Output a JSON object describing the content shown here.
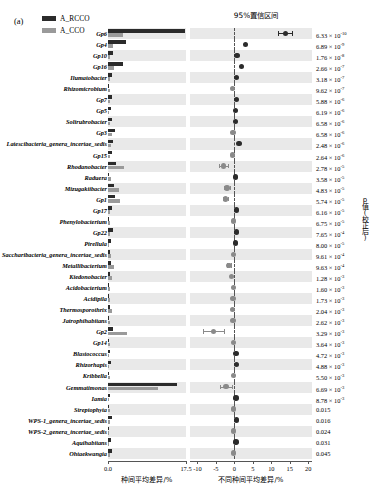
{
  "panel": {
    "label": "(a)"
  },
  "legend": {
    "items": [
      {
        "label": "A_RCCO",
        "color": "#2b2b2b"
      },
      {
        "label": "A_CCO",
        "color": "#9a9a9a"
      }
    ]
  },
  "titles": {
    "ci_title": "95%置信区间",
    "xlabel_left": "种间平均差异/%",
    "xlabel_right": "不同种间平均差异/%",
    "ylabel_right": "p值(校正后)"
  },
  "axes": {
    "left": {
      "ticks": [
        "0.0",
        "17.5"
      ],
      "min": 0,
      "max": 17.5
    },
    "right": {
      "ticks": [
        "-10",
        "-5",
        "0",
        "5",
        "10",
        "15",
        "20"
      ],
      "min": -12,
      "max": 21
    }
  },
  "chart_data": {
    "type": "bar",
    "title": "95%置信区间",
    "xlabel": "不同种间平均差异/%",
    "ylabel": "p值(校正后)",
    "series_names": [
      "A_RCCO",
      "A_CCO"
    ],
    "categories": [
      "Gp6",
      "Gp4",
      "Gp10",
      "Gp16",
      "Ilumatobacter",
      "Rhizomicrobium",
      "Gp7",
      "Gp5",
      "Solirubrobacter",
      "Gp3",
      "Latescibacteria_genera_incertae_sedis",
      "Gp15",
      "Rhodanobacter",
      "Raduera",
      "Mizugakiibacter",
      "Gp1",
      "Gp17",
      "Phenylobacterium",
      "Gp22",
      "Pirellula",
      "Saccharibacteria_genera_incertae_sedis",
      "Metallibacterium",
      "Kiedonobacter",
      "Acidobacterium",
      "Acidipila",
      "Thermosporothrix",
      "Jatrophihabitans",
      "Gp2",
      "Gp14",
      "Blastococcus",
      "Rhizorhapis",
      "Kribbella",
      "Gemmatimonas",
      "Iamia",
      "Streptophyta",
      "WPS-1_genera_incertae_sedis",
      "WPS-2_genera_incertae_sedis",
      "Aquihabitans",
      "Ohtaekwangia"
    ],
    "rows": [
      {
        "taxon": "Gp6",
        "rcco": 17.2,
        "cco": 3.4,
        "diff": 13.8,
        "ci_low": 11.9,
        "ci_high": 15.6,
        "p": "6.33 × 10",
        "p_exp": "-10"
      },
      {
        "taxon": "Gp4",
        "rcco": 4.0,
        "cco": 1.2,
        "diff": 3.0,
        "ci_low": 2.6,
        "ci_high": 3.4,
        "p": "6.89 × 10",
        "p_exp": "-9"
      },
      {
        "taxon": "Gp10",
        "rcco": 1.1,
        "cco": 0.5,
        "diff": 0.7,
        "ci_low": 0.5,
        "ci_high": 0.9,
        "p": "1.76 × 10",
        "p_exp": "-8"
      },
      {
        "taxon": "Gp16",
        "rcco": 3.3,
        "cco": 1.4,
        "diff": 1.9,
        "ci_low": 1.6,
        "ci_high": 2.2,
        "p": "2.66 × 10",
        "p_exp": "-7"
      },
      {
        "taxon": "Ilumatobacter",
        "rcco": 0.9,
        "cco": 0.4,
        "diff": 0.6,
        "ci_low": 0.4,
        "ci_high": 0.8,
        "p": "3.18 × 10",
        "p_exp": "-7"
      },
      {
        "taxon": "Rhizomicrobium",
        "rcco": 0.2,
        "cco": 0.5,
        "diff": -0.5,
        "ci_low": -0.8,
        "ci_high": -0.2,
        "p": "9.62 × 10",
        "p_exp": "-7"
      },
      {
        "taxon": "Gp7",
        "rcco": 1.0,
        "cco": 0.4,
        "diff": 0.5,
        "ci_low": 0.3,
        "ci_high": 0.7,
        "p": "5.88 × 10",
        "p_exp": "-6"
      },
      {
        "taxon": "Gp5",
        "rcco": 0.6,
        "cco": 0.3,
        "diff": 0.3,
        "ci_low": 0.2,
        "ci_high": 0.5,
        "p": "6.19 × 10",
        "p_exp": "-6"
      },
      {
        "taxon": "Solirubrobacter",
        "rcco": 0.9,
        "cco": 0.4,
        "diff": 0.3,
        "ci_low": 0.2,
        "ci_high": 0.5,
        "p": "6.58 × 10",
        "p_exp": "-6"
      },
      {
        "taxon": "Gp3",
        "rcco": 1.5,
        "cco": 0.9,
        "diff": -0.4,
        "ci_low": -0.7,
        "ci_high": -0.1,
        "p": "6.58 × 10",
        "p_exp": "-6"
      },
      {
        "taxon": "Latescibacteria_genera_incertae_sedis",
        "rcco": 1.2,
        "cco": 0.6,
        "diff": 1.2,
        "ci_low": 0.9,
        "ci_high": 1.5,
        "p": "2.48 × 10",
        "p_exp": "-6"
      },
      {
        "taxon": "Gp15",
        "rcco": 1.0,
        "cco": 0.5,
        "diff": -0.5,
        "ci_low": -0.8,
        "ci_high": -0.3,
        "p": "2.64 × 10",
        "p_exp": "-6"
      },
      {
        "taxon": "Rhodanobacter",
        "rcco": 1.8,
        "cco": 3.6,
        "diff": -3.0,
        "ci_low": -4.2,
        "ci_high": -1.8,
        "p": "2.78 × 10",
        "p_exp": "-5"
      },
      {
        "taxon": "Raduera",
        "rcco": 0.3,
        "cco": 0.6,
        "diff": 0.3,
        "ci_low": 0.1,
        "ci_high": 0.6,
        "p": "3.58 × 10",
        "p_exp": "-5"
      },
      {
        "taxon": "Mizugakiibacter",
        "rcco": 1.3,
        "cco": 2.4,
        "diff": -2.0,
        "ci_low": -2.8,
        "ci_high": -1.2,
        "p": "4.83 × 10",
        "p_exp": "-5"
      },
      {
        "taxon": "Gp1",
        "rcco": 1.6,
        "cco": 2.6,
        "diff": -2.4,
        "ci_low": -3.1,
        "ci_high": -1.7,
        "p": "5.74 × 10",
        "p_exp": "-5"
      },
      {
        "taxon": "Gp17",
        "rcco": 0.9,
        "cco": 0.4,
        "diff": 0.5,
        "ci_low": 0.3,
        "ci_high": 0.7,
        "p": "6.16 × 10",
        "p_exp": "-5"
      },
      {
        "taxon": "Phenylobacterium",
        "rcco": 0.2,
        "cco": 0.4,
        "diff": -0.2,
        "ci_low": -0.4,
        "ci_high": 0.0,
        "p": "6.75 × 10",
        "p_exp": "-5"
      },
      {
        "taxon": "Gp22",
        "rcco": 1.1,
        "cco": 0.5,
        "diff": 0.6,
        "ci_low": 0.4,
        "ci_high": 0.8,
        "p": "7.65 × 10",
        "p_exp": "-4"
      },
      {
        "taxon": "Pirellula",
        "rcco": 0.6,
        "cco": 0.3,
        "diff": 0.3,
        "ci_low": 0.1,
        "ci_high": 0.5,
        "p": "8.00 × 10",
        "p_exp": "-5"
      },
      {
        "taxon": "Saccharibacteria_genera_incertae_sedis",
        "rcco": 0.5,
        "cco": 0.7,
        "diff": -0.3,
        "ci_low": -0.5,
        "ci_high": -0.1,
        "p": "9.61 × 10",
        "p_exp": "-4"
      },
      {
        "taxon": "Metallibacterium",
        "rcco": 0.7,
        "cco": 1.4,
        "diff": -1.5,
        "ci_low": -2.1,
        "ci_high": -0.9,
        "p": "9.63 × 10",
        "p_exp": "-4"
      },
      {
        "taxon": "Kiedonobacter",
        "rcco": 0.5,
        "cco": 0.9,
        "diff": -0.8,
        "ci_low": -1.2,
        "ci_high": -0.4,
        "p": "1.28 × 10",
        "p_exp": "-3"
      },
      {
        "taxon": "Acidobacterium",
        "rcco": 0.2,
        "cco": 0.5,
        "diff": -0.3,
        "ci_low": -0.5,
        "ci_high": -0.1,
        "p": "1.60 × 10",
        "p_exp": "-3"
      },
      {
        "taxon": "Acidipila",
        "rcco": 0.2,
        "cco": 0.4,
        "diff": -0.4,
        "ci_low": -0.7,
        "ci_high": -0.2,
        "p": "1.73 × 10",
        "p_exp": "-3"
      },
      {
        "taxon": "Thermosporothrix",
        "rcco": 0.5,
        "cco": 0.9,
        "diff": -0.5,
        "ci_low": -0.8,
        "ci_high": -0.2,
        "p": "2.04 × 10",
        "p_exp": "-3"
      },
      {
        "taxon": "Jatrophihabitans",
        "rcco": 0.2,
        "cco": 0.4,
        "diff": -0.4,
        "ci_low": -0.6,
        "ci_high": -0.1,
        "p": "2.62 × 10",
        "p_exp": "-3"
      },
      {
        "taxon": "Gp2",
        "rcco": 1.2,
        "cco": 4.3,
        "diff": -5.6,
        "ci_low": -8.4,
        "ci_high": -2.9,
        "p": "3.29 × 10",
        "p_exp": "-3"
      },
      {
        "taxon": "Gp14",
        "rcco": 0.3,
        "cco": 0.5,
        "diff": -0.3,
        "ci_low": -0.5,
        "ci_high": -0.1,
        "p": "3.64 × 10",
        "p_exp": "-3"
      },
      {
        "taxon": "Blastococcus",
        "rcco": 0.4,
        "cco": 0.2,
        "diff": 0.4,
        "ci_low": 0.2,
        "ci_high": 0.6,
        "p": "4.72 × 10",
        "p_exp": "-3"
      },
      {
        "taxon": "Rhizorhapis",
        "rcco": 0.7,
        "cco": 0.3,
        "diff": 0.5,
        "ci_low": 0.3,
        "ci_high": 0.8,
        "p": "4.88 × 10",
        "p_exp": "-3"
      },
      {
        "taxon": "Kribbella",
        "rcco": 0.2,
        "cco": 0.4,
        "diff": -0.2,
        "ci_low": -0.4,
        "ci_high": 0.0,
        "p": "5.50 × 10",
        "p_exp": "-3"
      },
      {
        "taxon": "Gemmatimonas",
        "rcco": 15.4,
        "cco": 11.2,
        "diff": -2.3,
        "ci_low": -3.9,
        "ci_high": -0.7,
        "p": "6.69 × 10",
        "p_exp": "-3"
      },
      {
        "taxon": "Iamia",
        "rcco": 0.5,
        "cco": 0.2,
        "diff": 0.4,
        "ci_low": 0.2,
        "ci_high": 0.7,
        "p": "8.78 × 10",
        "p_exp": "-3"
      },
      {
        "taxon": "Streptophyta",
        "rcco": 0.2,
        "cco": 0.4,
        "diff": -0.2,
        "ci_low": -0.4,
        "ci_high": 0.0,
        "p": "0.015",
        "p_exp": ""
      },
      {
        "taxon": "WPS-1_genera_incertae_sedis",
        "rcco": 0.9,
        "cco": 0.4,
        "diff": 0.6,
        "ci_low": 0.3,
        "ci_high": 0.9,
        "p": "0.016",
        "p_exp": ""
      },
      {
        "taxon": "WPS-2_genera_incertae_sedis",
        "rcco": 0.2,
        "cco": 0.3,
        "diff": -0.2,
        "ci_low": -0.4,
        "ci_high": 0.0,
        "p": "0.024",
        "p_exp": ""
      },
      {
        "taxon": "Aquihabitans",
        "rcco": 0.6,
        "cco": 0.3,
        "diff": 0.4,
        "ci_low": 0.2,
        "ci_high": 0.7,
        "p": "0.031",
        "p_exp": ""
      },
      {
        "taxon": "Ohtaekwangia",
        "rcco": 0.8,
        "cco": 0.5,
        "diff": -0.2,
        "ci_low": -0.6,
        "ci_high": 0.2,
        "p": "0.045",
        "p_exp": ""
      }
    ]
  }
}
